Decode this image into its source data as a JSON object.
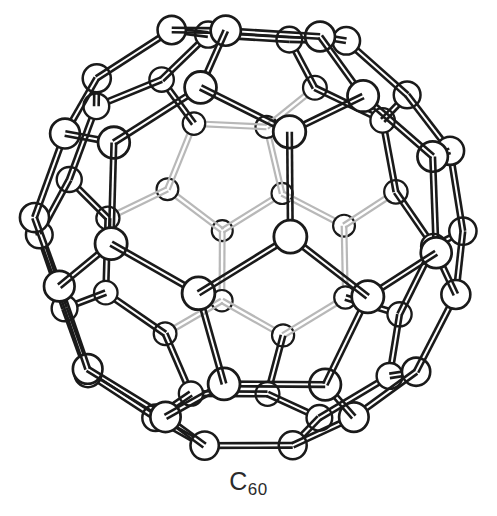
{
  "figure": {
    "kind": "molecular-structure-diagram",
    "title_label": "C",
    "subscript_label": "60",
    "caption_full": "C60",
    "molecule_name": "Buckminsterfullerene",
    "model_style": "ball-and-stick",
    "polyhedron": "truncated icosahedron",
    "atom_count": 60,
    "bond_count": 90,
    "element": "C",
    "pentagon_faces": 12,
    "hexagon_faces": 20,
    "background_color": "#ffffff",
    "line_color": "#1a1a1a",
    "atom_fill_color": "#ffffff",
    "hidden_line_color": "#b8b8b8",
    "caption_color": "#2b2b2b",
    "stroke_width": 2.6,
    "bond_tube_gap": 4.6,
    "view": {
      "width": 497,
      "height": 516,
      "drawing_height": 466,
      "center_x": 249,
      "center_y": 233,
      "scale": 212,
      "rotation_x_deg": -11,
      "rotation_y_deg": 9,
      "perspective": 4.6,
      "front_atom_radius": 16.5,
      "back_atom_radius": 10.5
    }
  },
  "geometry": {
    "description": "Unit-sphere vertices of a truncated icosahedron (C60). Coordinates are cyclic permutations of (0,+/-1,+/-3p), (+/-1,+/-(2+p),+/-2p), (+/-p,+/-2,+/-(2p+1)) with p the golden ratio, normalized.",
    "golden_ratio": 1.618033988749895,
    "vertices": [
      [
        0,
        1,
        4.854102
      ],
      [
        0,
        1,
        -4.854102
      ],
      [
        0,
        -1,
        4.854102
      ],
      [
        0,
        -1,
        -4.854102
      ],
      [
        1,
        4.854102,
        0
      ],
      [
        1,
        -4.854102,
        0
      ],
      [
        -1,
        4.854102,
        0
      ],
      [
        -1,
        -4.854102,
        0
      ],
      [
        4.854102,
        0,
        1
      ],
      [
        -4.854102,
        0,
        1
      ],
      [
        4.854102,
        0,
        -1
      ],
      [
        -4.854102,
        0,
        -1
      ],
      [
        1,
        3.618034,
        3.236068
      ],
      [
        1,
        3.618034,
        -3.236068
      ],
      [
        1,
        -3.618034,
        3.236068
      ],
      [
        1,
        -3.618034,
        -3.236068
      ],
      [
        -1,
        3.618034,
        3.236068
      ],
      [
        -1,
        3.618034,
        -3.236068
      ],
      [
        -1,
        -3.618034,
        3.236068
      ],
      [
        -1,
        -3.618034,
        -3.236068
      ],
      [
        3.618034,
        3.236068,
        1
      ],
      [
        3.618034,
        3.236068,
        -1
      ],
      [
        3.618034,
        -3.236068,
        1
      ],
      [
        3.618034,
        -3.236068,
        -1
      ],
      [
        -3.618034,
        3.236068,
        1
      ],
      [
        -3.618034,
        3.236068,
        -1
      ],
      [
        -3.618034,
        -3.236068,
        1
      ],
      [
        -3.618034,
        -3.236068,
        -1
      ],
      [
        3.236068,
        1,
        3.618034
      ],
      [
        3.236068,
        1,
        -3.618034
      ],
      [
        3.236068,
        -1,
        3.618034
      ],
      [
        3.236068,
        -1,
        -3.618034
      ],
      [
        -3.236068,
        1,
        3.618034
      ],
      [
        -3.236068,
        1,
        -3.618034
      ],
      [
        -3.236068,
        -1,
        3.618034
      ],
      [
        -3.236068,
        -1,
        -3.618034
      ],
      [
        1.618034,
        2,
        4.236068
      ],
      [
        1.618034,
        2,
        -4.236068
      ],
      [
        1.618034,
        -2,
        4.236068
      ],
      [
        1.618034,
        -2,
        -4.236068
      ],
      [
        -1.618034,
        2,
        4.236068
      ],
      [
        -1.618034,
        2,
        -4.236068
      ],
      [
        -1.618034,
        -2,
        4.236068
      ],
      [
        -1.618034,
        -2,
        -4.236068
      ],
      [
        2,
        4.236068,
        1.618034
      ],
      [
        2,
        4.236068,
        -1.618034
      ],
      [
        2,
        -4.236068,
        1.618034
      ],
      [
        2,
        -4.236068,
        -1.618034
      ],
      [
        -2,
        4.236068,
        1.618034
      ],
      [
        -2,
        4.236068,
        -1.618034
      ],
      [
        -2,
        -4.236068,
        1.618034
      ],
      [
        -2,
        -4.236068,
        -1.618034
      ],
      [
        4.236068,
        1.618034,
        2
      ],
      [
        4.236068,
        1.618034,
        -2
      ],
      [
        4.236068,
        -1.618034,
        2
      ],
      [
        4.236068,
        -1.618034,
        -2
      ],
      [
        -4.236068,
        1.618034,
        2
      ],
      [
        -4.236068,
        1.618034,
        -2
      ],
      [
        -4.236068,
        -1.618034,
        2
      ],
      [
        -4.236068,
        -1.618034,
        -2
      ]
    ],
    "bond_length_unit": 2.0,
    "bond_length_tolerance": 0.06
  }
}
